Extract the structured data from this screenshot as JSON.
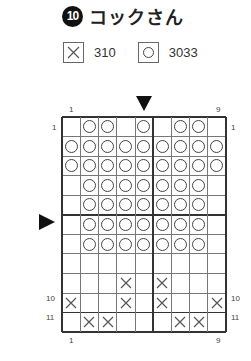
{
  "title": {
    "number": "10",
    "text": "コックさん"
  },
  "legend": [
    {
      "symbol": "x",
      "label": "310"
    },
    {
      "symbol": "o",
      "label": "3033"
    }
  ],
  "chart_data": {
    "type": "table",
    "title": "コックさん",
    "cols": 9,
    "rows": 11,
    "column_ticks": {
      "top": [
        "1",
        "9"
      ],
      "bottom": [
        "1",
        "9"
      ]
    },
    "row_ticks": {
      "left": [
        "1",
        "10",
        "11"
      ],
      "right": [
        "1",
        "10",
        "11"
      ]
    },
    "center_markers": {
      "column": 5,
      "row": 6
    },
    "legend": {
      "x": "310",
      "o": "3033"
    },
    "grid": [
      [
        ".",
        "o",
        "o",
        ".",
        "o",
        ".",
        "o",
        "o",
        "."
      ],
      [
        "o",
        "o",
        "o",
        "o",
        "o",
        "o",
        "o",
        "o",
        "o"
      ],
      [
        "o",
        "o",
        "o",
        "o",
        "o",
        "o",
        "o",
        "o",
        "o"
      ],
      [
        ".",
        "o",
        "o",
        "o",
        "o",
        "o",
        "o",
        "o",
        "."
      ],
      [
        ".",
        "o",
        "o",
        "o",
        "o",
        "o",
        "o",
        "o",
        "."
      ],
      [
        ".",
        "o",
        "o",
        "o",
        "o",
        "o",
        "o",
        "o",
        "."
      ],
      [
        ".",
        "o",
        "o",
        "o",
        "o",
        "o",
        "o",
        "o",
        "."
      ],
      [
        ".",
        ".",
        ".",
        ".",
        ".",
        ".",
        ".",
        ".",
        "."
      ],
      [
        ".",
        ".",
        ".",
        "x",
        ".",
        "x",
        ".",
        ".",
        "."
      ],
      [
        "x",
        ".",
        ".",
        "x",
        ".",
        "x",
        ".",
        ".",
        "x"
      ],
      [
        ".",
        "x",
        "x",
        ".",
        ".",
        ".",
        "x",
        "x",
        "."
      ]
    ]
  },
  "ticks": {
    "top_first": "1",
    "top_last": "9",
    "bottom_first": "1",
    "bottom_last": "9",
    "left_1": "1",
    "left_10": "10",
    "left_11": "11",
    "right_1": "1",
    "right_10": "10",
    "right_11": "11"
  }
}
